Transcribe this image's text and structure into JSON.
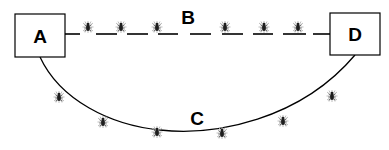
{
  "diagram": {
    "nodes": [
      {
        "id": "A",
        "label": "A",
        "x": 15,
        "y": 14,
        "w": 50,
        "h": 43
      },
      {
        "id": "D",
        "label": "D",
        "x": 330,
        "y": 13,
        "w": 50,
        "h": 42
      }
    ],
    "edges": [
      {
        "id": "B",
        "label": "B",
        "style": "dashed",
        "from": "A",
        "to": "D",
        "label_x": 188,
        "label_y": 24
      },
      {
        "id": "C",
        "label": "C",
        "style": "solid-curve",
        "from": "A",
        "to": "D",
        "label_x": 197,
        "label_y": 125
      }
    ],
    "insects": {
      "icon": "bug-icon",
      "on_path_B": [
        {
          "x": 88,
          "y": 27
        },
        {
          "x": 121,
          "y": 27
        },
        {
          "x": 157,
          "y": 27
        },
        {
          "x": 225,
          "y": 27
        },
        {
          "x": 264,
          "y": 27
        },
        {
          "x": 298,
          "y": 27
        }
      ],
      "near_path_C": [
        {
          "x": 59,
          "y": 97
        },
        {
          "x": 103,
          "y": 122
        },
        {
          "x": 157,
          "y": 132
        },
        {
          "x": 222,
          "y": 133
        },
        {
          "x": 283,
          "y": 121
        },
        {
          "x": 332,
          "y": 96
        }
      ]
    },
    "colors": {
      "stroke": "#000000",
      "background": "#ffffff",
      "insect": "#222222",
      "insect_halo": "#bbbbbb"
    }
  }
}
